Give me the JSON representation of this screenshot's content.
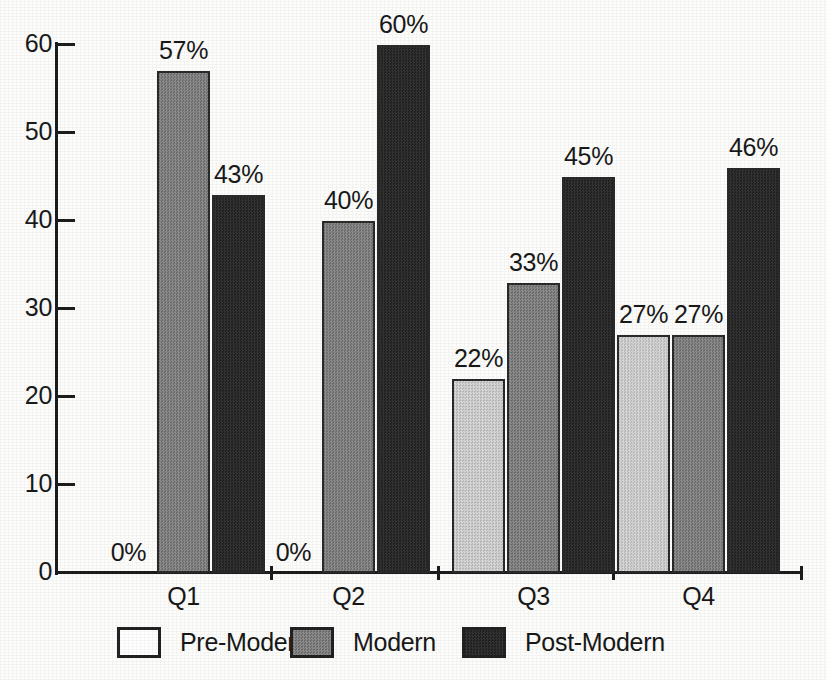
{
  "chart_data": {
    "type": "bar",
    "title": "",
    "subtitle": "",
    "xlabel": "",
    "ylabel": "",
    "ylim": [
      0,
      60
    ],
    "yticks": [
      0,
      10,
      20,
      30,
      40,
      50,
      60
    ],
    "grid": false,
    "legend_position": "bottom",
    "categories": [
      "Q1",
      "Q2",
      "Q3",
      "Q4"
    ],
    "series": [
      {
        "name": "Pre-Modern",
        "color": "#c9c9c9",
        "values": [
          0,
          0,
          22,
          27
        ],
        "labels": [
          "0%",
          "0%",
          "22%",
          "27%"
        ]
      },
      {
        "name": "Modern",
        "color": "#7e7e7e",
        "values": [
          57,
          40,
          33,
          27
        ],
        "labels": [
          "57%",
          "40%",
          "33%",
          "27%"
        ]
      },
      {
        "name": "Post-Modern",
        "color": "#2b2b2b",
        "values": [
          43,
          60,
          45,
          46
        ],
        "labels": [
          "43%",
          "60%",
          "45%",
          "46%"
        ]
      }
    ]
  },
  "axis": {
    "y_tick_labels": [
      "0",
      "10",
      "20",
      "30",
      "40",
      "50",
      "60"
    ]
  },
  "legend": {
    "items": [
      {
        "label": "Pre-Modern",
        "swatch": "white-square-icon"
      },
      {
        "label": "Modern",
        "swatch": "gray-square-icon"
      },
      {
        "label": "Post-Modern",
        "swatch": "black-square-icon"
      }
    ]
  }
}
